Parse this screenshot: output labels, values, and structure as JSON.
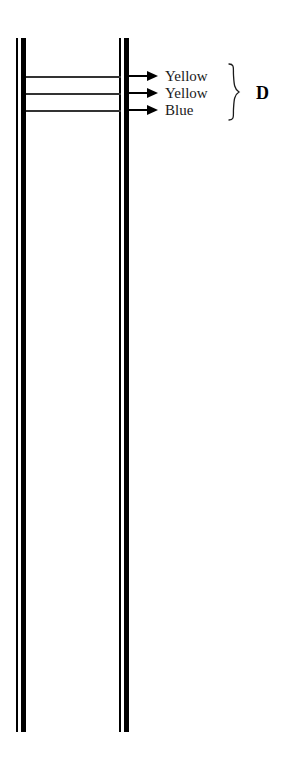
{
  "figure": {
    "colors": {
      "wall": "#000000",
      "band": "#333333",
      "arrow": "#000000",
      "text": "#1a1a1a",
      "background": "#ffffff"
    },
    "column_left": {
      "name": "left-column-wall",
      "thin_wall": "thin-line",
      "thick_wall": "thick-line"
    },
    "column_right": {
      "name": "right-column-wall",
      "thin_wall": "thin-line",
      "thick_wall": "thick-line"
    },
    "bands": [
      {
        "label": "Yellow",
        "arrow_icon": "arrow-right-icon"
      },
      {
        "label": "Yellow",
        "arrow_icon": "arrow-right-icon"
      },
      {
        "label": "Blue",
        "arrow_icon": "arrow-right-icon"
      }
    ],
    "group": {
      "brace_icon": "right-curly-brace-icon",
      "letter": "D"
    }
  }
}
